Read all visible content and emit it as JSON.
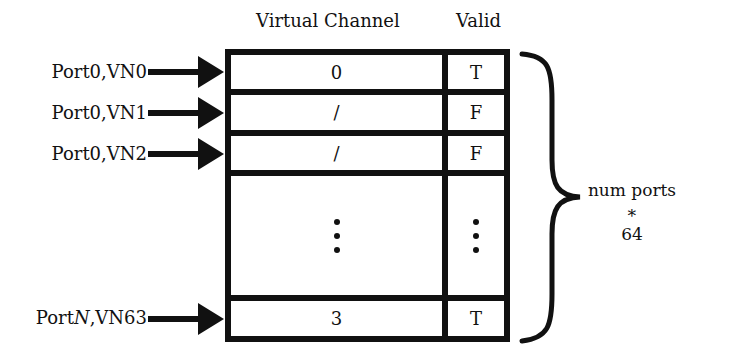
{
  "headers": {
    "virtual_channel": "Virtual Channel",
    "valid": "Valid"
  },
  "rows": [
    {
      "input": "Port0,VN0",
      "vc": "0",
      "valid": "T"
    },
    {
      "input": "Port0,VN1",
      "vc": "/",
      "valid": "F"
    },
    {
      "input": "Port0,VN2",
      "vc": "/",
      "valid": "F"
    },
    {
      "input": "",
      "vc": "⋮",
      "valid": "⋮"
    },
    {
      "input_prefix": "Port",
      "input_var": "N",
      "input_suffix": ",VN63",
      "vc": "3",
      "valid": "T"
    }
  ],
  "brace": {
    "line1": "num ports ∗",
    "line2": "64"
  }
}
